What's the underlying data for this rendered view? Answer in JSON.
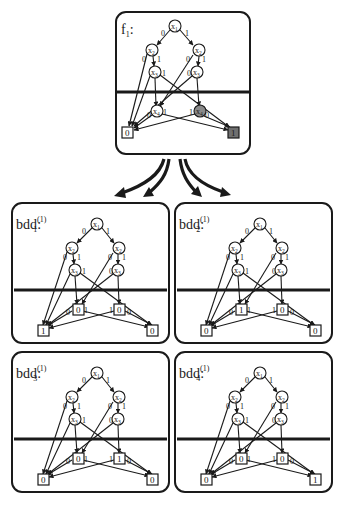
{
  "figure": {
    "main_panel": {
      "title": "f",
      "title_subscript": "1",
      "title_suffix": ":",
      "nodes": [
        {
          "id": "x1",
          "var": "x",
          "index": "1"
        },
        {
          "id": "x2L",
          "var": "x",
          "index": "2"
        },
        {
          "id": "x2R",
          "var": "x",
          "index": "2"
        },
        {
          "id": "x3L",
          "var": "x",
          "index": "3"
        },
        {
          "id": "x3R",
          "var": "x",
          "index": "3"
        },
        {
          "id": "x4L",
          "var": "x",
          "index": "4"
        },
        {
          "id": "x4R",
          "var": "x",
          "index": "4",
          "shaded": true
        }
      ],
      "terminals": {
        "left": "0",
        "right": "1",
        "right_shaded": true
      },
      "edge_labels": {
        "zero": "0",
        "one": "1"
      }
    },
    "arrows_count": 4,
    "sub_panels": [
      {
        "name": "bdd",
        "subscript": "1",
        "superscript": "(1)",
        "suffix": ":",
        "cut_terminals": {
          "left": "0",
          "right": "0"
        },
        "terminals": {
          "left": "1",
          "right": "0"
        }
      },
      {
        "name": "bdd",
        "subscript": "2",
        "superscript": "(1)",
        "suffix": ":",
        "cut_terminals": {
          "left": "1",
          "right": "0"
        },
        "terminals": {
          "left": "0",
          "right": "0"
        }
      },
      {
        "name": "bdd",
        "subscript": "3",
        "superscript": "(1)",
        "suffix": ":",
        "cut_terminals": {
          "left": "0",
          "right": "1"
        },
        "terminals": {
          "left": "0",
          "right": "0"
        }
      },
      {
        "name": "bdd",
        "subscript": "4",
        "superscript": "(1)",
        "suffix": ":",
        "cut_terminals": {
          "left": "0",
          "right": "0"
        },
        "terminals": {
          "left": "0",
          "right": "1"
        }
      }
    ]
  }
}
